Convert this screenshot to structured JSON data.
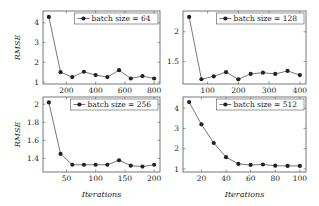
{
  "figure": {
    "ylabel": "RMSE",
    "xlabel": "Iterations"
  },
  "chart_data": [
    {
      "type": "line",
      "legend": "batch size = 64",
      "legend_position": "top-right",
      "x": [
        80,
        160,
        240,
        320,
        400,
        480,
        560,
        640,
        720,
        800
      ],
      "values": [
        4.3,
        1.5,
        1.25,
        1.52,
        1.35,
        1.25,
        1.6,
        1.18,
        1.3,
        1.18
      ],
      "xlim": [
        40,
        840
      ],
      "ylim": [
        0.9,
        4.6
      ],
      "xticks": [
        200,
        400,
        600,
        800
      ],
      "yticks": [
        1,
        2,
        3,
        4
      ],
      "ytick_labels": [
        "1",
        "2",
        "3",
        "4"
      ],
      "xlabel": "",
      "ylabel": "RMSE",
      "grid": false
    },
    {
      "type": "line",
      "legend": "batch size = 128",
      "legend_position": "top-right",
      "x": [
        40,
        80,
        120,
        160,
        200,
        240,
        280,
        320,
        360,
        400
      ],
      "values": [
        2.25,
        1.2,
        1.25,
        1.32,
        1.2,
        1.29,
        1.31,
        1.29,
        1.34,
        1.27
      ],
      "xlim": [
        20,
        420
      ],
      "ylim": [
        1.12,
        2.35
      ],
      "xticks": [
        100,
        200,
        300,
        400
      ],
      "yticks": [
        1.5,
        2
      ],
      "ytick_labels": [
        "1.5",
        "2"
      ],
      "xlabel": "",
      "ylabel": "",
      "grid": false
    },
    {
      "type": "line",
      "legend": "batch size = 256",
      "legend_position": "top-right",
      "x": [
        20,
        40,
        60,
        80,
        100,
        120,
        140,
        160,
        180,
        200
      ],
      "values": [
        2.02,
        1.45,
        1.33,
        1.33,
        1.33,
        1.33,
        1.38,
        1.32,
        1.31,
        1.33
      ],
      "xlim": [
        10,
        210
      ],
      "ylim": [
        1.25,
        2.08
      ],
      "xticks": [
        50,
        100,
        150,
        200
      ],
      "yticks": [
        1.4,
        1.6,
        1.8,
        2
      ],
      "ytick_labels": [
        "1.4",
        "1.6",
        "1.8",
        "2"
      ],
      "xlabel": "Iterations",
      "ylabel": "RMSE",
      "grid": false
    },
    {
      "type": "line",
      "legend": "batch size = 512",
      "legend_position": "top-right",
      "x": [
        10,
        20,
        30,
        40,
        50,
        60,
        70,
        80,
        90,
        100
      ],
      "values": [
        4.3,
        3.2,
        2.28,
        1.58,
        1.25,
        1.2,
        1.22,
        1.16,
        1.15,
        1.15
      ],
      "xlim": [
        5,
        105
      ],
      "ylim": [
        0.85,
        4.55
      ],
      "xticks": [
        20,
        40,
        60,
        80,
        100
      ],
      "yticks": [
        1,
        2,
        3,
        4
      ],
      "ytick_labels": [
        "1",
        "2",
        "3",
        "4"
      ],
      "xlabel": "Iterations",
      "ylabel": "",
      "grid": false
    }
  ],
  "panels_layout": [
    {
      "left": 43,
      "top": 11,
      "right": 160,
      "bottom": 84
    },
    {
      "left": 183,
      "top": 11,
      "right": 306,
      "bottom": 84
    },
    {
      "left": 43,
      "top": 97,
      "right": 160,
      "bottom": 172
    },
    {
      "left": 183,
      "top": 97,
      "right": 306,
      "bottom": 172
    }
  ],
  "style": {
    "line_color": "#555555",
    "marker_color": "#222222",
    "axis_color": "#555555",
    "text_color": "#222222"
  }
}
